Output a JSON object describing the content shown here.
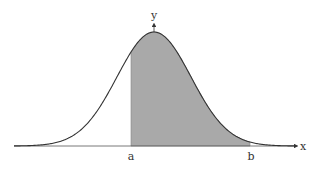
{
  "figure": {
    "type": "normal-distribution-area",
    "axis_labels": {
      "x": "x",
      "y": "y"
    },
    "bounds": {
      "lower": "a",
      "upper": "b"
    },
    "colors": {
      "shade": "#a9a9a9",
      "curve": "#333333",
      "axis": "#555555"
    }
  }
}
